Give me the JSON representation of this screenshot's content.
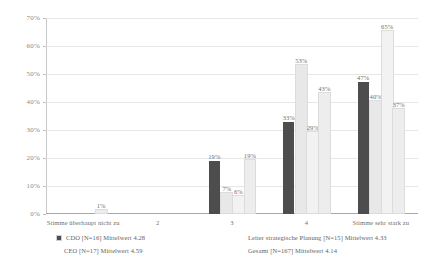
{
  "chart_data": {
    "type": "bar",
    "title": "",
    "xlabel": "",
    "ylabel": "",
    "ylim": [
      0,
      70
    ],
    "ystep": 10,
    "grid": true,
    "legend_position": "bottom",
    "ytick_labels": [
      "0%",
      "10%",
      "20%",
      "30%",
      "40%",
      "50%",
      "60%",
      "70%"
    ],
    "categories": [
      "Stimme überhaupt nicht zu",
      "2",
      "3",
      "4",
      "Stimme sehr stark zu"
    ],
    "series": [
      {
        "name": "CDO [N=16] Mittelwert 4.28",
        "color": "#4d4d4d",
        "values": [
          0,
          0,
          19,
          33,
          47
        ],
        "labels": [
          "",
          "",
          "19%",
          "33%",
          "47%"
        ]
      },
      {
        "name": "CEO [N=17] Mittelwert 4.59",
        "color": "#e8e8e8",
        "values": [
          0,
          0,
          7,
          53,
          40
        ],
        "labels": [
          "",
          "",
          "7%",
          "53%",
          "40%"
        ]
      },
      {
        "name": "Leiter strategische Planung [N=15] Mittelwert 4.33",
        "color": "#f2f2f2",
        "values": [
          0,
          0,
          6,
          29,
          65
        ],
        "labels": [
          "",
          "",
          "6%",
          "29%",
          "65%"
        ]
      },
      {
        "name": "Gesamt [N=167] Mittelwert 4.14",
        "color": "#ededed",
        "values": [
          1,
          0,
          19,
          43,
          37
        ],
        "labels": [
          "1%",
          "",
          "19%",
          "43%",
          "37%"
        ]
      }
    ]
  },
  "legend": {
    "items": [
      {
        "label": "CDO [N=16] Mittelwert 4.28",
        "color": "#4d4d4d",
        "marker": true
      },
      {
        "label": "Leiter strategische Planung [N=15] Mittelwert 4.33",
        "color": "#f2f2f2",
        "marker": false
      },
      {
        "label": "CEO [N=17] Mittelwert 4.59",
        "color": "#e8e8e8",
        "marker": false
      },
      {
        "label": "Gesamt [N=167] Mittelwert 4.14",
        "color": "#ededed",
        "marker": false
      }
    ]
  }
}
